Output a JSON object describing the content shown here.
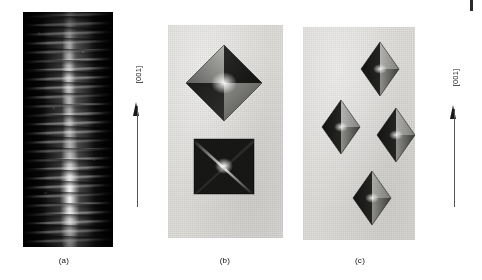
{
  "figure": {
    "background_color": "#ffffff",
    "panels": [
      {
        "id": "a",
        "caption": "(a)",
        "kind": "dark-micrograph",
        "description": "Dark-field micrograph of a crystal whisker showing periodic horizontal striations and a bright vertical core",
        "background_color": "#090909"
      },
      {
        "id": "b",
        "caption": "(b)",
        "kind": "photographic-print",
        "description": "Photographic print showing an octahedral crystal and a square-projected octahedron",
        "background_color": "#dddcd9",
        "crystals": [
          {
            "name": "octahedron",
            "habit": "octahedral",
            "orientation": "three-fold view"
          },
          {
            "name": "square-projection",
            "habit": "octahedral",
            "orientation": "four-fold axis view"
          }
        ]
      },
      {
        "id": "c",
        "caption": "(c)",
        "kind": "photographic-print",
        "description": "Photographic print showing four elongated bipyramidal crystals in a diamond arrangement",
        "background_color": "#dddcd9",
        "crystals": [
          {
            "name": "bipyramid-top",
            "habit": "elongated bipyramidal"
          },
          {
            "name": "bipyramid-left",
            "habit": "elongated bipyramidal"
          },
          {
            "name": "bipyramid-right",
            "habit": "elongated bipyramidal"
          },
          {
            "name": "bipyramid-bottom",
            "habit": "elongated bipyramidal"
          }
        ]
      }
    ],
    "direction_arrows": [
      {
        "id": "left",
        "label": "[001]",
        "points": "up"
      },
      {
        "id": "right",
        "label": "[001]",
        "points": "up"
      }
    ],
    "colors": {
      "ink": "#111111",
      "print_paper": "#dddcd9",
      "micrograph_dark": "#090909",
      "crystal_dark": "#1c1c1c",
      "crystal_mid": "#6e6e6e",
      "crystal_light": "#b9b9b9"
    }
  }
}
